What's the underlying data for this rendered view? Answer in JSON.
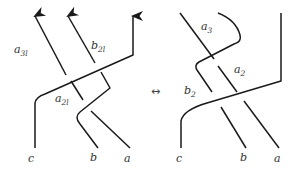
{
  "left_diagram": {
    "labels": {
      "a3l": {
        "base": "a",
        "sub": "3l"
      },
      "b2l": {
        "base": "b",
        "sub": "2l"
      },
      "a2l": {
        "base": "a",
        "sub": "2l"
      }
    },
    "endpoints": {
      "c": "c",
      "b": "b",
      "a": "a"
    }
  },
  "equivalence_symbol": "↔",
  "right_diagram": {
    "labels": {
      "a3": {
        "base": "a",
        "sub": "3"
      },
      "a2": {
        "base": "a",
        "sub": "2"
      },
      "b2": {
        "base": "b",
        "sub": "2"
      }
    },
    "endpoints": {
      "c": "c",
      "b": "b",
      "a": "a"
    }
  },
  "colors": {
    "stroke": "#1a1a1a",
    "text": "#333333",
    "background": "#ffffff"
  }
}
